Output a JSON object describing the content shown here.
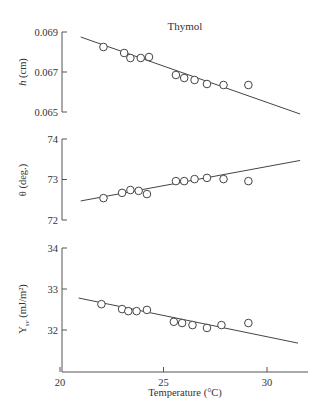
{
  "chart_data": [
    {
      "type": "scatter",
      "panel": "top",
      "title": "Thymol",
      "xlabel": "",
      "ylabel": "h (cm)",
      "ylabel_main": "h",
      "ylabel_unit": " (cm)",
      "ylim": [
        0.065,
        0.069
      ],
      "yticks": [
        0.069,
        0.067,
        0.065
      ],
      "ytick_labels": [
        "0.069",
        "0.067",
        "0.065"
      ],
      "xlim": [
        20,
        32
      ],
      "grid": false,
      "x": [
        22.1,
        23.1,
        23.4,
        23.9,
        24.3,
        25.6,
        26.0,
        26.5,
        27.1,
        27.9,
        29.1
      ],
      "y": [
        0.06825,
        0.06795,
        0.0677,
        0.0677,
        0.06775,
        0.06685,
        0.0667,
        0.0666,
        0.0664,
        0.06635,
        0.06635
      ],
      "fit_line": {
        "x": [
          21.0,
          31.6
        ],
        "y": [
          0.06875,
          0.0649
        ]
      }
    },
    {
      "type": "scatter",
      "panel": "middle",
      "title": "",
      "xlabel": "",
      "ylabel": "θ (deg.)",
      "ylim": [
        72,
        74
      ],
      "yticks": [
        74,
        73,
        72
      ],
      "ytick_labels": [
        "74",
        "73",
        "72"
      ],
      "xlim": [
        20,
        32
      ],
      "grid": false,
      "x": [
        22.1,
        23.0,
        23.4,
        23.8,
        24.2,
        25.6,
        26.0,
        26.5,
        27.1,
        27.9,
        29.1
      ],
      "y": [
        72.54,
        72.67,
        72.74,
        72.72,
        72.64,
        72.96,
        72.96,
        73.01,
        73.04,
        73.01,
        72.96
      ],
      "fit_line": {
        "x": [
          21.0,
          31.6
        ],
        "y": [
          72.47,
          73.47
        ]
      }
    },
    {
      "type": "scatter",
      "panel": "bottom",
      "title": "",
      "xlabel": "Temperature (°C)",
      "ylabel": "γsv (mJ/m²)",
      "ylabel_main": "Y",
      "ylabel_sub": "sv",
      "ylabel_unit": " (mJ/m²)",
      "ylim": [
        31,
        34
      ],
      "yticks": [
        34,
        33,
        32
      ],
      "ytick_labels": [
        "34",
        "33",
        "32"
      ],
      "xlim": [
        20,
        32
      ],
      "xticks": [
        20,
        25,
        30
      ],
      "xtick_labels": [
        "20",
        "25",
        "30"
      ],
      "grid": false,
      "x": [
        22.0,
        23.0,
        23.3,
        23.7,
        24.2,
        25.5,
        25.9,
        26.4,
        27.1,
        27.8,
        29.1
      ],
      "y": [
        32.63,
        32.51,
        32.46,
        32.46,
        32.49,
        32.2,
        32.17,
        32.12,
        32.05,
        32.12,
        32.17
      ],
      "fit_line": {
        "x": [
          20.9,
          31.5
        ],
        "y": [
          32.78,
          31.68
        ]
      }
    }
  ],
  "layout": {
    "x_axis_px": {
      "x20": 60,
      "x30": 267
    },
    "panels_px": [
      {
        "ytop": 32,
        "ybot": 112,
        "vtop": 0.069,
        "vbot": 0.065,
        "axis_top": 32,
        "axis_bot": 112
      },
      {
        "ytop": 139,
        "ybot": 220,
        "vtop": 74,
        "vbot": 72,
        "axis_top": 139,
        "axis_bot": 220
      },
      {
        "ytop": 248,
        "ybot": 330,
        "vtop": 34,
        "vbot": 32,
        "axis_top": 248,
        "axis_bot": 372
      }
    ]
  }
}
